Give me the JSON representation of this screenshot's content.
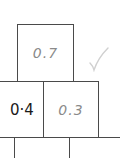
{
  "pyramid": {
    "top": {
      "value": "0.7",
      "style": "handwritten"
    },
    "middle_left": {
      "value": "0·4",
      "style": "printed"
    },
    "middle_right": {
      "value": "0.3",
      "style": "handwritten"
    },
    "mark": "check-mark"
  },
  "colors": {
    "handwriting": "#8a8a8a",
    "printed": "#1a1a1a",
    "lines": "#4a4a4a",
    "check": "#d0d0d0"
  }
}
